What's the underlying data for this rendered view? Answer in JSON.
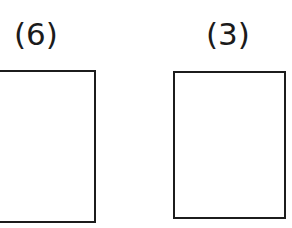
{
  "figure": {
    "background_color": "#ffffff",
    "stroke_color": "#1c1c1c",
    "text_color": "#1b1b1b",
    "panels": [
      {
        "label": "(6)",
        "name": "panel-6",
        "clipped": "left-edge",
        "content": ""
      },
      {
        "label": "(3)",
        "name": "panel-3",
        "clipped": "none",
        "content": ""
      }
    ]
  }
}
